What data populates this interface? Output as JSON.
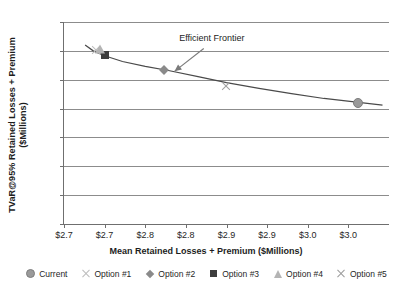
{
  "chart_data": {
    "type": "scatter",
    "title": "",
    "xlabel": "Mean Retained Losses + Premium ($Millions)",
    "ylabel_line1": "TVaR@95% Retained Losses + Premium",
    "ylabel_line2": "($Millions)",
    "xlim": [
      2.65,
      3.05
    ],
    "ylim": [
      0,
      7
    ],
    "grid": true,
    "legend_position": "bottom",
    "ytick_labels": [
      "$7",
      "$6",
      "$5",
      "$4",
      "$3",
      "$2",
      "$1",
      "$-"
    ],
    "ytick_values": [
      7,
      6,
      5,
      4,
      3,
      2,
      1,
      0
    ],
    "xtick_labels": [
      "$2.7",
      "$2.7",
      "$2.8",
      "$2.8",
      "$2.9",
      "$2.9",
      "$3.0",
      "$3.0"
    ],
    "xtick_values": [
      2.65,
      2.7,
      2.75,
      2.8,
      2.85,
      2.9,
      2.95,
      3.0
    ],
    "annotations": [
      {
        "text": "Efficient Frontier",
        "x": 2.832,
        "y": 6.4,
        "arrow_from_x": 2.822,
        "arrow_from_y": 6.08,
        "arrow_to_x": 2.786,
        "arrow_to_y": 5.29
      }
    ],
    "series": [
      {
        "name": "Current",
        "marker": "circle",
        "color": "#9a9a9a",
        "x": [
          3.012
        ],
        "y": [
          4.2
        ]
      },
      {
        "name": "Option #1",
        "marker": "x",
        "color": "#bdbdbd",
        "x": [
          2.689
        ],
        "y": [
          6.02
        ]
      },
      {
        "name": "Option #2",
        "marker": "diamond",
        "color": "#8a8a8a",
        "x": [
          2.773
        ],
        "y": [
          5.33
        ]
      },
      {
        "name": "Option #3",
        "marker": "square",
        "color": "#3d3d3d",
        "x": [
          2.7
        ],
        "y": [
          5.85
        ]
      },
      {
        "name": "Option #4",
        "marker": "triangle",
        "color": "#b4b4b4",
        "x": [
          2.694
        ],
        "y": [
          6.08
        ]
      },
      {
        "name": "Option #5",
        "marker": "x",
        "color": "#a0a0a0",
        "x": [
          2.849
        ],
        "y": [
          4.78
        ]
      }
    ],
    "frontier_curve": {
      "name": "Efficient Frontier",
      "color": "#4a4a4a",
      "x": [
        2.676,
        2.686,
        2.7,
        2.722,
        2.75,
        2.78,
        2.815,
        2.85,
        2.89,
        2.93,
        2.97,
        3.01,
        3.042
      ],
      "y": [
        6.2,
        6.0,
        5.83,
        5.63,
        5.46,
        5.31,
        5.11,
        4.9,
        4.7,
        4.52,
        4.35,
        4.22,
        4.12
      ]
    }
  },
  "legend": {
    "items": [
      {
        "label": "Current",
        "marker": "circle"
      },
      {
        "label": "Option #1",
        "marker": "x-light"
      },
      {
        "label": "Option #2",
        "marker": "diamond"
      },
      {
        "label": "Option #3",
        "marker": "square"
      },
      {
        "label": "Option #4",
        "marker": "triangle"
      },
      {
        "label": "Option #5",
        "marker": "x-dark"
      }
    ]
  }
}
